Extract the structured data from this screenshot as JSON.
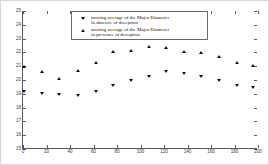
{
  "chart_data": {
    "type": "scatter",
    "title": "",
    "xlabel": "",
    "ylabel": "",
    "xlim": [
      0,
      200
    ],
    "ylim": [
      15,
      25
    ],
    "grid": false,
    "legend_position": "upper-center",
    "xticks": [
      0,
      20,
      40,
      60,
      80,
      100,
      120,
      140,
      160,
      180,
      200
    ],
    "yticks": [
      15,
      16,
      17,
      18,
      19,
      20,
      21,
      22,
      23,
      24,
      25
    ],
    "xticklabels": [
      "0",
      "20",
      "40",
      "60",
      "80",
      "100",
      "120",
      "140",
      "160",
      "180",
      "200"
    ],
    "yticklabels": [
      "15",
      "16",
      "17",
      "18",
      "19",
      "20",
      "21",
      "22",
      "23",
      "24",
      "25"
    ],
    "series": [
      {
        "name": "moving average of the Major Diameter in absence of deception",
        "marker": "triangle-down",
        "color": "#0d0d0d",
        "x": [
          1,
          16,
          31,
          47,
          62,
          77,
          92,
          107,
          122,
          137,
          152,
          167,
          182,
          196
        ],
        "y": [
          19.1,
          18.95,
          18.9,
          18.85,
          19.15,
          19.6,
          19.95,
          20.25,
          20.55,
          20.4,
          20.25,
          19.95,
          19.6,
          19.45
        ]
      },
      {
        "name": "moving average of the Major Diameter in presence of deception",
        "marker": "triangle-up",
        "color": "#0d0d0d",
        "x": [
          1,
          16,
          31,
          47,
          62,
          77,
          92,
          107,
          122,
          137,
          152,
          167,
          182,
          196
        ],
        "y": [
          20.95,
          20.55,
          20.1,
          20.65,
          21.2,
          22.0,
          22.1,
          22.4,
          22.3,
          22.05,
          21.95,
          21.7,
          21.25,
          21.05
        ]
      }
    ]
  },
  "legend": {
    "entries": [
      {
        "line1": "moving average of the Major Diameter",
        "line2": "in absence of deception",
        "marker": "triangle-down-icon"
      },
      {
        "line1": "moving average of the Major Diameter",
        "line2": "in presence of deception",
        "marker": "triangle-up-icon"
      }
    ]
  }
}
